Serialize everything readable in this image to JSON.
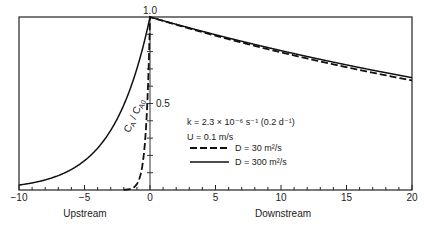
{
  "chart_data": {
    "type": "line",
    "title": "",
    "xlabel_left": "Upstream",
    "xlabel_right": "Downstream",
    "ylabel": "C_A / C_A0",
    "xlim": [
      -10,
      20
    ],
    "ylim": [
      0,
      1.0
    ],
    "x_ticks_major": [
      -10,
      -5,
      0,
      5,
      10,
      15,
      20
    ],
    "x_tick_labels": [
      "−10",
      "−5",
      "0",
      "5",
      "10",
      "15",
      "20"
    ],
    "y_tick_labels": [
      {
        "value": 1.0,
        "label": "1.0"
      },
      {
        "value": 0.5,
        "label": "0.5"
      }
    ],
    "grid": false,
    "legend_placement": "center-right",
    "annotations": {
      "k": "k = 2.3 × 10⁻⁶ s⁻¹ (0.2 d⁻¹)",
      "U": "U = 0.1 m/s"
    },
    "series": [
      {
        "name": "D = 30 m²/s",
        "style": "dashed",
        "upstream_rate_per_unit": 3.356,
        "downstream_rate_per_unit": -0.02285,
        "points": [
          [
            -2,
            0.0012
          ],
          [
            -1.5,
            0.0065
          ],
          [
            -1,
            0.035
          ],
          [
            -0.5,
            0.187
          ],
          [
            0,
            1.0
          ],
          [
            5,
            0.892
          ],
          [
            10,
            0.796
          ],
          [
            15,
            0.71
          ],
          [
            20,
            0.633
          ]
        ]
      },
      {
        "name": "D = 300 m²/s",
        "style": "solid",
        "upstream_rate_per_unit": 0.355,
        "downstream_rate_per_unit": -0.0216,
        "points": [
          [
            -10,
            0.029
          ],
          [
            -8,
            0.058
          ],
          [
            -6,
            0.119
          ],
          [
            -4,
            0.242
          ],
          [
            -2,
            0.492
          ],
          [
            0,
            1.0
          ],
          [
            5,
            0.898
          ],
          [
            10,
            0.806
          ],
          [
            15,
            0.723
          ],
          [
            20,
            0.649
          ]
        ]
      }
    ]
  }
}
